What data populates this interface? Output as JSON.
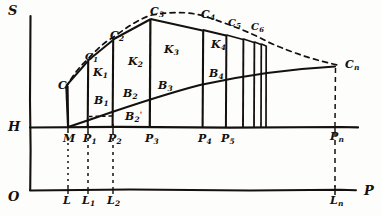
{
  "figure": {
    "style": "hand-drawn line diagram, black ink on off-white paper",
    "ink_color": "#14100d",
    "paper_color": "#fdfdfb"
  },
  "axes": {
    "vertical_label": "S",
    "horizontal_label": "P",
    "origin_label": "O",
    "h_line_label": "H",
    "vertical_axis_x": 30,
    "h_line_y": 127,
    "base_line_y": 190
  },
  "h_line_ticks": [
    {
      "label": "M",
      "sub": "",
      "x": 68
    },
    {
      "label": "P",
      "sub": "1",
      "x": 88
    },
    {
      "label": "P",
      "sub": "2",
      "x": 113
    },
    {
      "label": "P",
      "sub": "3",
      "x": 150
    },
    {
      "label": "P",
      "sub": "4",
      "x": 203
    },
    {
      "label": "P",
      "sub": "5",
      "x": 226
    },
    {
      "label": "P",
      "sub": "n",
      "x": 335
    }
  ],
  "base_line_ticks": [
    {
      "label": "L",
      "sub": "",
      "x": 68
    },
    {
      "label": "L",
      "sub": "1",
      "x": 88
    },
    {
      "label": "L",
      "sub": "2",
      "x": 113
    },
    {
      "label": "L",
      "sub": "n",
      "x": 335
    }
  ],
  "step_tops": [
    {
      "label": "C",
      "sub": "",
      "x": 62,
      "y": 85
    },
    {
      "label": "C",
      "sub": "1",
      "x": 90,
      "y": 58
    },
    {
      "label": "C",
      "sub": "2",
      "x": 117,
      "y": 37
    },
    {
      "label": "C",
      "sub": "3",
      "x": 156,
      "y": 13
    },
    {
      "label": "C",
      "sub": "4",
      "x": 207,
      "y": 15
    },
    {
      "label": "C",
      "sub": "5",
      "x": 233,
      "y": 24
    },
    {
      "label": "C",
      "sub": "6",
      "x": 256,
      "y": 28
    },
    {
      "label": "C",
      "sub": "n",
      "x": 350,
      "y": 66
    }
  ],
  "k_labels": [
    {
      "label": "K",
      "sub": "1",
      "x": 96,
      "y": 73
    },
    {
      "label": "K",
      "sub": "2",
      "x": 131,
      "y": 63
    },
    {
      "label": "K",
      "sub": "3",
      "x": 167,
      "y": 50
    },
    {
      "label": "K",
      "sub": "4",
      "x": 214,
      "y": 45
    }
  ],
  "b_labels": [
    {
      "label": "B",
      "sub": "1",
      "prime": "",
      "x": 97,
      "y": 101
    },
    {
      "label": "B",
      "sub": "2",
      "prime": "",
      "x": 126,
      "y": 94
    },
    {
      "label": "B",
      "sub": "3",
      "prime": "",
      "x": 161,
      "y": 86
    },
    {
      "label": "B",
      "sub": "4",
      "prime": "",
      "x": 212,
      "y": 74
    },
    {
      "label": "B",
      "sub": "2",
      "prime": "'",
      "x": 129,
      "y": 117
    }
  ],
  "geometry": {
    "step_verticals_x": [
      68,
      88,
      113,
      150,
      203,
      226,
      243,
      254,
      261,
      266
    ],
    "dashed_drop_x": [
      68,
      88,
      113,
      335
    ],
    "envelope": "dashed arc rising from C through C1..C6 and descending to Cn",
    "growth_curve": "solid concave curve from M rising to the right and flattening near Cn level"
  }
}
